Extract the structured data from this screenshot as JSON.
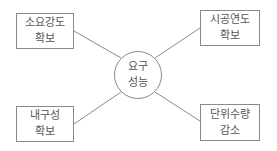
{
  "diagram": {
    "center": {
      "line1": "요구",
      "line2": "성능"
    },
    "nodes": [
      {
        "id": "top-left",
        "line1": "소요강도",
        "line2": "확보"
      },
      {
        "id": "top-right",
        "line1": "시공연도",
        "line2": "확보"
      },
      {
        "id": "bottom-left",
        "line1": "내구성",
        "line2": "확보"
      },
      {
        "id": "bottom-right",
        "line1": "단위수량",
        "line2": "감소"
      }
    ],
    "colors": {
      "stroke": "#8a8a8a",
      "text": "#555555",
      "background": "#ffffff"
    }
  }
}
